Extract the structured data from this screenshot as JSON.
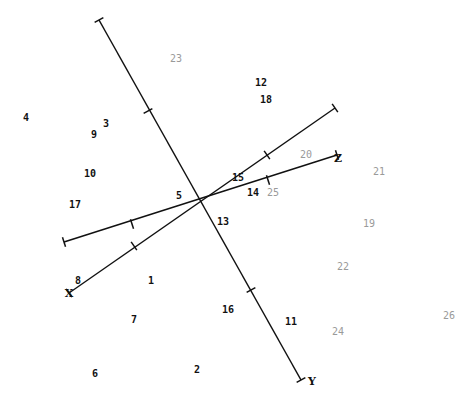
{
  "chart_data": {
    "type": "scatter",
    "title": "",
    "origin": [
      200,
      201
    ],
    "axes": [
      {
        "name": "Y",
        "label": "Y",
        "from": [
          99,
          20
        ],
        "to": [
          301,
          380
        ],
        "ticks": [
          [
            148,
            111
          ],
          [
            251,
            290
          ]
        ],
        "label_pos": [
          312,
          381
        ]
      },
      {
        "name": "X",
        "label": "X",
        "from": [
          64,
          242
        ],
        "to": [
          335,
          108
        ],
        "ticks": [
          [
            132,
            224
          ],
          [
            267,
            155
          ]
        ],
        "label_pos": [
          69,
          293
        ]
      },
      {
        "name": "Z",
        "label": "Z",
        "from": [
          64,
          242
        ],
        "to": [
          337,
          155
        ],
        "ticks": [
          [
            132,
            224
          ],
          [
            268,
            180
          ]
        ],
        "label_pos": [
          338,
          158
        ]
      },
      {
        "name": "X2",
        "label": "",
        "from": [
          69,
          293
        ],
        "to": [
          335,
          108
        ],
        "ticks": [
          [
            134,
            246
          ],
          [
            267,
            155
          ]
        ]
      }
    ],
    "points": [
      {
        "id": "1",
        "x": 151,
        "y": 281,
        "shade": "dark"
      },
      {
        "id": "2",
        "x": 197,
        "y": 370,
        "shade": "dark"
      },
      {
        "id": "3",
        "x": 106,
        "y": 124,
        "shade": "dark"
      },
      {
        "id": "4",
        "x": 26,
        "y": 118,
        "shade": "dark"
      },
      {
        "id": "5",
        "x": 179,
        "y": 196,
        "shade": "dark"
      },
      {
        "id": "6",
        "x": 95,
        "y": 374,
        "shade": "dark"
      },
      {
        "id": "7",
        "x": 134,
        "y": 320,
        "shade": "dark"
      },
      {
        "id": "8",
        "x": 78,
        "y": 281,
        "shade": "dark"
      },
      {
        "id": "9",
        "x": 94,
        "y": 135,
        "shade": "dark"
      },
      {
        "id": "10",
        "x": 90,
        "y": 174,
        "shade": "dark"
      },
      {
        "id": "11",
        "x": 291,
        "y": 322,
        "shade": "dark"
      },
      {
        "id": "12",
        "x": 261,
        "y": 83,
        "shade": "dark"
      },
      {
        "id": "13",
        "x": 223,
        "y": 222,
        "shade": "dark"
      },
      {
        "id": "14",
        "x": 253,
        "y": 193,
        "shade": "dark"
      },
      {
        "id": "15",
        "x": 238,
        "y": 178,
        "shade": "dark"
      },
      {
        "id": "16",
        "x": 228,
        "y": 310,
        "shade": "dark"
      },
      {
        "id": "17",
        "x": 75,
        "y": 205,
        "shade": "dark"
      },
      {
        "id": "18",
        "x": 266,
        "y": 100,
        "shade": "dark"
      },
      {
        "id": "19",
        "x": 369,
        "y": 224,
        "shade": "gray"
      },
      {
        "id": "20",
        "x": 306,
        "y": 155,
        "shade": "gray"
      },
      {
        "id": "21",
        "x": 379,
        "y": 172,
        "shade": "gray"
      },
      {
        "id": "22",
        "x": 343,
        "y": 267,
        "shade": "gray"
      },
      {
        "id": "23",
        "x": 176,
        "y": 59,
        "shade": "gray"
      },
      {
        "id": "24",
        "x": 338,
        "y": 332,
        "shade": "gray"
      },
      {
        "id": "25",
        "x": 273,
        "y": 193,
        "shade": "gray"
      },
      {
        "id": "26",
        "x": 449,
        "y": 316,
        "shade": "gray"
      }
    ],
    "colors": {
      "axis": "#111111",
      "dark": "#111111",
      "gray": "#9a9a9a",
      "background": "#ffffff"
    },
    "grid": false,
    "legend": null
  }
}
